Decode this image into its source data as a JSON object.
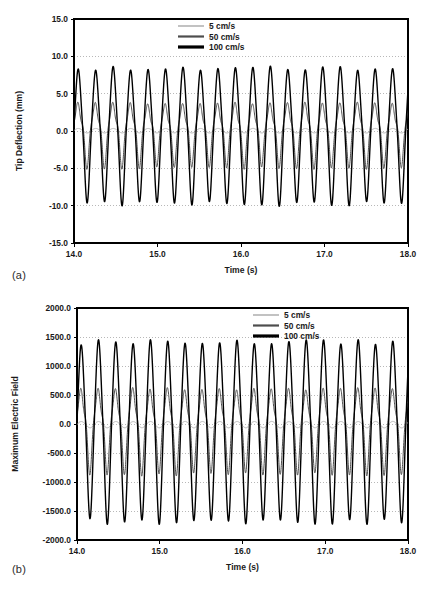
{
  "figure": {
    "background": "#ffffff",
    "panels": [
      {
        "tag": "(a)",
        "xlabel": "Time (s)",
        "ylabel": "Tip Deflection (mm)"
      },
      {
        "tag": "(b)",
        "xlabel": "Time (s)",
        "ylabel": "Maximum Electric Field"
      }
    ]
  },
  "style": {
    "series_colors": [
      "#b3b3b3",
      "#4d4d4d",
      "#000000"
    ],
    "series_widths": [
      1.0,
      1.0,
      1.4
    ],
    "frame_color": "#000000",
    "grid_color": "#9a9a9a",
    "text_color": "#1a1a1a"
  },
  "chart_data": [
    {
      "type": "line",
      "panel": "(a)",
      "title": "",
      "xlabel": "Time (s)",
      "ylabel": "Tip Deflection (mm)",
      "xlim": [
        14.0,
        18.0
      ],
      "ylim": [
        -15.0,
        15.0
      ],
      "xticks": [
        14.0,
        15.0,
        16.0,
        17.0,
        18.0
      ],
      "xtick_labels": [
        "14.0",
        "15.0",
        "16.0",
        "17.0",
        "18.0"
      ],
      "yticks": [
        15.0,
        10.0,
        5.0,
        0.0,
        -5.0,
        -10.0,
        -15.0
      ],
      "ytick_labels": [
        "15.0",
        "10.0",
        "5.0",
        "0.0",
        "-5.0",
        "-10.0",
        "-15.0"
      ],
      "grid": true,
      "grid_axis": "y",
      "legend_position": "top-center",
      "frequency_hz": 4.78,
      "series": [
        {
          "name": "5 cm/s",
          "color": "#b3b3b3",
          "width": 1.0,
          "amplitude": 0.3,
          "offset": 0.05,
          "harmonic2": 0.1,
          "flatten": 0.0,
          "phase": 0.0
        },
        {
          "name": "50 cm/s",
          "color": "#4d4d4d",
          "width": 1.0,
          "amplitude": 4.1,
          "offset": 0.1,
          "harmonic2": 0.95,
          "flatten": 0.55,
          "phase": 0.12
        },
        {
          "name": "100 cm/s",
          "color": "#000000",
          "width": 1.4,
          "amplitude": 8.9,
          "offset": -0.15,
          "harmonic2": 0.3,
          "flatten": 0.18,
          "phase": 0.02
        }
      ]
    },
    {
      "type": "line",
      "panel": "(b)",
      "title": "",
      "xlabel": "Time (s)",
      "ylabel": "Maximum Electric Field",
      "xlim": [
        14.0,
        18.0
      ],
      "ylim": [
        -2000.0,
        2000.0
      ],
      "xticks": [
        14.0,
        15.0,
        16.0,
        17.0,
        18.0
      ],
      "xtick_labels": [
        "14.0",
        "15.0",
        "16.0",
        "17.0",
        "18.0"
      ],
      "yticks": [
        2000.0,
        1500.0,
        1000.0,
        500.0,
        0.0,
        -500.0,
        -1000.0,
        -1500.0,
        -2000.0
      ],
      "ytick_labels": [
        "2000.0",
        "1500.0",
        "1000.0",
        "500.0",
        "0.0",
        "-500.0",
        "-1000.0",
        "-1500.0",
        "-2000.0"
      ],
      "grid": true,
      "grid_axis": "y",
      "legend_position": "top-center",
      "frequency_hz": 4.78,
      "series": [
        {
          "name": "5 cm/s",
          "color": "#b3b3b3",
          "width": 1.0,
          "amplitude": 55,
          "offset": -10,
          "harmonic2": 0.12,
          "flatten": 0.0,
          "phase": 0.0
        },
        {
          "name": "50 cm/s",
          "color": "#4d4d4d",
          "width": 1.0,
          "amplitude": 700,
          "offset": -15,
          "harmonic2": 0.9,
          "flatten": 0.5,
          "phase": 0.12
        },
        {
          "name": "100 cm/s",
          "color": "#000000",
          "width": 1.4,
          "amplitude": 1520,
          "offset": -70,
          "harmonic2": 0.22,
          "flatten": 0.14,
          "phase": 0.02
        }
      ]
    }
  ],
  "legend": {
    "entries": [
      {
        "label": "5 cm/s",
        "color": "#b3b3b3",
        "width": 1.6
      },
      {
        "label": "50 cm/s",
        "color": "#4d4d4d",
        "width": 2.2
      },
      {
        "label": "100 cm/s",
        "color": "#000000",
        "width": 3.2
      }
    ]
  }
}
